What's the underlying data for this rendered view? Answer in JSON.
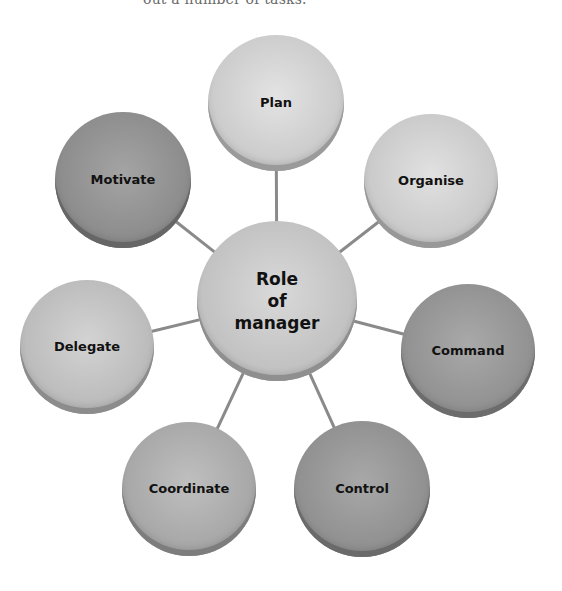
{
  "caption": "out a number of tasks.",
  "diagram": {
    "center": {
      "label": "Role\nof\nmanager",
      "cx": 277,
      "cy": 301,
      "r": 80,
      "color": "#c3c3c3",
      "shade": "#8f8f8f"
    },
    "nodes": [
      {
        "id": "plan",
        "label": "Plan",
        "cx": 276,
        "cy": 103,
        "r": 68,
        "color": "#cdcdcd",
        "shade": "#9a9a9a"
      },
      {
        "id": "organise",
        "label": "Organise",
        "cx": 431,
        "cy": 181,
        "r": 67,
        "color": "#cbcbcb",
        "shade": "#989898"
      },
      {
        "id": "command",
        "label": "Command",
        "cx": 468,
        "cy": 351,
        "r": 67,
        "color": "#939393",
        "shade": "#6c6c6c"
      },
      {
        "id": "control",
        "label": "Control",
        "cx": 362,
        "cy": 489,
        "r": 68,
        "color": "#929292",
        "shade": "#6a6a6a"
      },
      {
        "id": "coordinate",
        "label": "Coordinate",
        "cx": 189,
        "cy": 489,
        "r": 67,
        "color": "#a9a9a9",
        "shade": "#7d7d7d"
      },
      {
        "id": "delegate",
        "label": "Delegate",
        "cx": 87,
        "cy": 347,
        "r": 67,
        "color": "#bdbdbd",
        "shade": "#8c8c8c"
      },
      {
        "id": "motivate",
        "label": "Motivate",
        "cx": 123,
        "cy": 180,
        "r": 68,
        "color": "#8e8e8e",
        "shade": "#666666"
      }
    ],
    "connector_color": "#8a8a8a"
  }
}
